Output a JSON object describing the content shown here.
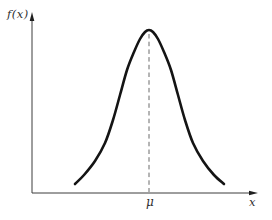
{
  "labels": {
    "y_axis": "f(x)",
    "x_axis": "x",
    "mean": "μ"
  },
  "colors": {
    "background": "#ffffff",
    "axis": "#3d3d3d",
    "arrow": "#1f1f1f",
    "curve": "#141414",
    "dashed": "#6b6b6b",
    "text": "#2e2e2e"
  },
  "chart_data": {
    "type": "line",
    "title": "",
    "xlabel": "x",
    "ylabel": "f(x)",
    "grid": false,
    "legend": false,
    "x_ticks": [
      {
        "label": "μ",
        "x_px": 149
      }
    ],
    "y_ticks": [],
    "series": [
      {
        "name": "bell-shaped density curve",
        "points_px": [
          [
            75,
            184
          ],
          [
            84,
            175
          ],
          [
            95,
            161
          ],
          [
            105,
            143
          ],
          [
            113,
            120
          ],
          [
            120,
            95
          ],
          [
            127,
            70
          ],
          [
            134,
            52
          ],
          [
            140,
            39
          ],
          [
            145,
            32
          ],
          [
            149,
            30
          ],
          [
            153,
            32
          ],
          [
            158,
            39
          ],
          [
            164,
            52
          ],
          [
            171,
            70
          ],
          [
            178,
            95
          ],
          [
            185,
            120
          ],
          [
            193,
            143
          ],
          [
            203,
            161
          ],
          [
            214,
            175
          ],
          [
            224,
            184
          ]
        ]
      }
    ],
    "annotations": [
      {
        "type": "dashed_vertical",
        "label": "μ",
        "x_px": 149,
        "y_top_px": 34,
        "y_bottom_px": 192
      }
    ],
    "axes_px": {
      "origin": [
        32,
        193
      ],
      "x_tip": [
        258,
        193
      ],
      "y_tip": [
        32,
        12
      ]
    }
  }
}
